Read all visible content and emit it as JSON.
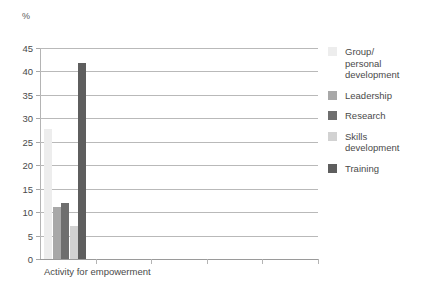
{
  "chart_data": {
    "type": "bar",
    "title": "Figure: Activity for empowerment",
    "subtitle": "",
    "xlabel": "",
    "ylabel": "%",
    "categories": [
      "Activity for empowerment"
    ],
    "ylim": [
      0,
      45
    ],
    "ytick_labels": [
      "0",
      "5",
      "10",
      "15",
      "20",
      "25",
      "30",
      "35",
      "40",
      "45"
    ],
    "ytick_values": [
      0,
      5,
      10,
      15,
      20,
      25,
      30,
      35,
      40,
      45
    ],
    "grid": true,
    "legend_position": "right",
    "empty_category_ticks": 4,
    "series": [
      {
        "name": "Group/\npersonal\ndevelopment",
        "values": [
          27.8
        ],
        "color": "#ededed"
      },
      {
        "name": "Leadership",
        "values": [
          11.0
        ],
        "color": "#a8a8a8"
      },
      {
        "name": "Research",
        "values": [
          11.9
        ],
        "color": "#6e6e6e"
      },
      {
        "name": "Skills\ndevelopment",
        "values": [
          7.0
        ],
        "color": "#d2d2d2"
      },
      {
        "name": "Training",
        "values": [
          41.8
        ],
        "color": "#5e5e5e"
      }
    ]
  },
  "axis": {
    "unit_symbol": "%",
    "x_category_label": "Activity for empowerment"
  },
  "legend": {
    "items": [
      {
        "label": "Group/\npersonal\ndevelopment",
        "color": "#ededed"
      },
      {
        "label": "Leadership",
        "color": "#a8a8a8"
      },
      {
        "label": "Research",
        "color": "#6e6e6e"
      },
      {
        "label": "Skills\ndevelopment",
        "color": "#d2d2d2"
      },
      {
        "label": "Training",
        "color": "#5e5e5e"
      }
    ]
  },
  "colors": {
    "gridline": "#b9b9b9",
    "axis": "#b4b4b4",
    "text": "#4a4a4a",
    "background": "#ffffff"
  }
}
